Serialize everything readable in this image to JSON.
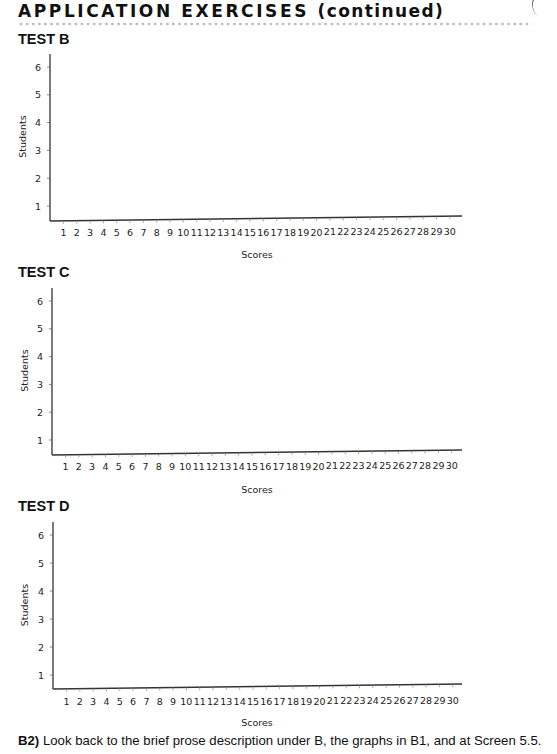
{
  "header": {
    "title": "APPLICATION EXERCISES",
    "continued": "(continued)"
  },
  "charts": [
    {
      "id": "B",
      "title": "TEST B"
    },
    {
      "id": "C",
      "title": "TEST C"
    },
    {
      "id": "D",
      "title": "TEST D"
    }
  ],
  "footer": {
    "label": "B2)",
    "text": " Look back to the brief prose description under B, the graphs in B1, and at Screen 5.5."
  },
  "chart_data": [
    {
      "type": "bar",
      "title": "TEST B",
      "xlabel": "Scores",
      "ylabel": "Students",
      "categories": [
        1,
        2,
        3,
        4,
        5,
        6,
        7,
        8,
        9,
        10,
        11,
        12,
        13,
        14,
        15,
        16,
        17,
        18,
        19,
        20,
        21,
        22,
        23,
        24,
        25,
        26,
        27,
        28,
        29,
        30
      ],
      "values": [],
      "yticks": [
        1,
        2,
        3,
        4,
        5,
        6
      ],
      "ylim": [
        0.5,
        6.5
      ],
      "grid": false,
      "note": "blank axes for student to fill in"
    },
    {
      "type": "bar",
      "title": "TEST C",
      "xlabel": "Scores",
      "ylabel": "Students",
      "categories": [
        1,
        2,
        3,
        4,
        5,
        6,
        7,
        8,
        9,
        10,
        11,
        12,
        13,
        14,
        15,
        16,
        17,
        18,
        19,
        20,
        21,
        22,
        23,
        24,
        25,
        26,
        27,
        28,
        29,
        30
      ],
      "values": [],
      "yticks": [
        1,
        2,
        3,
        4,
        5,
        6
      ],
      "ylim": [
        0.5,
        6.5
      ],
      "grid": false,
      "note": "blank axes for student to fill in"
    },
    {
      "type": "bar",
      "title": "TEST D",
      "xlabel": "Scores",
      "ylabel": "Students",
      "categories": [
        1,
        2,
        3,
        4,
        5,
        6,
        7,
        8,
        9,
        10,
        11,
        12,
        13,
        14,
        15,
        16,
        17,
        18,
        19,
        20,
        21,
        22,
        23,
        24,
        25,
        26,
        27,
        28,
        29,
        30
      ],
      "values": [],
      "yticks": [
        1,
        2,
        3,
        4,
        5,
        6
      ],
      "ylim": [
        0.5,
        6.5
      ],
      "grid": false,
      "note": "blank axes for student to fill in"
    }
  ]
}
